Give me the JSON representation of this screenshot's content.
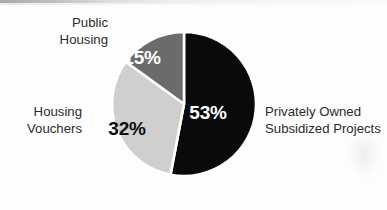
{
  "chart_data": {
    "type": "pie",
    "title": "",
    "subtitle": "",
    "xlabel": "",
    "ylabel": "",
    "legend_position": "outside-callout-labels",
    "grid": false,
    "units": "percent",
    "categories": [
      "Privately Owned Subsidized Projects",
      "Housing Vouchers",
      "Public Housing"
    ],
    "values": [
      53,
      32,
      15
    ],
    "value_labels": [
      "53%",
      "32%",
      "15%"
    ],
    "slice_colors": [
      "#0a0a0a",
      "#cfcfcf",
      "#6b6b6b"
    ],
    "series": [
      {
        "name": "Share of assisted housing units",
        "values": [
          53,
          32,
          15
        ]
      }
    ],
    "slices": [
      {
        "label": "Privately Owned Subsidized Projects",
        "value": 53,
        "value_label": "53%",
        "color": "#0a0a0a",
        "label_color": "#ffffff",
        "start_angle_deg": 0,
        "end_angle_deg": 190.8
      },
      {
        "label": "Housing Vouchers",
        "value": 32,
        "value_label": "32%",
        "color": "#cfcfcf",
        "label_color": "#0d0d0d",
        "start_angle_deg": 190.8,
        "end_angle_deg": 306.0
      },
      {
        "label": "Public Housing",
        "value": 15,
        "value_label": "15%",
        "color": "#6b6b6b",
        "label_color": "#ffffff",
        "start_angle_deg": 306.0,
        "end_angle_deg": 360.0
      }
    ]
  },
  "figure": {
    "background_color": "#fdfdfd",
    "separator_color": "#ffffff",
    "pie": {
      "center_x": 184,
      "center_y": 104,
      "radius": 72
    }
  },
  "labels": {
    "public_housing": {
      "line1": "Public",
      "line2": "Housing"
    },
    "housing_vouchers": {
      "line1": "Housing",
      "line2": "Vouchers"
    },
    "privately_owned": {
      "line1": "Privately Owned",
      "line2": "Subsidized Projects"
    }
  },
  "values": {
    "privately_owned_pct": "53%",
    "housing_vouchers_pct": "32%",
    "public_housing_pct": "15%"
  }
}
